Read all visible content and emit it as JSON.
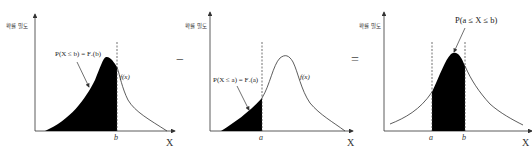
{
  "diagram": {
    "y_axis_label": "확률 밀도",
    "x_axis_label": "X",
    "operators": {
      "minus": "−",
      "equals": "="
    },
    "panels": [
      {
        "id": "cdf-b",
        "annotation": "P(X ≤ b) = Fₓ(b)",
        "curve_label": "f(x)",
        "ticks": [
          "b"
        ],
        "shaded": "left of b"
      },
      {
        "id": "cdf-a",
        "annotation": "P(X ≤ a) = Fₓ(a)",
        "curve_label": "f(x)",
        "ticks": [
          "a"
        ],
        "shaded": "left of a"
      },
      {
        "id": "interval",
        "annotation": "P(a ≤ X ≤ b)",
        "ticks": [
          "a",
          "b"
        ],
        "shaded": "between a and b"
      }
    ],
    "colors": {
      "fill": "#000000",
      "line": "#333333",
      "background": "#ffffff"
    }
  }
}
